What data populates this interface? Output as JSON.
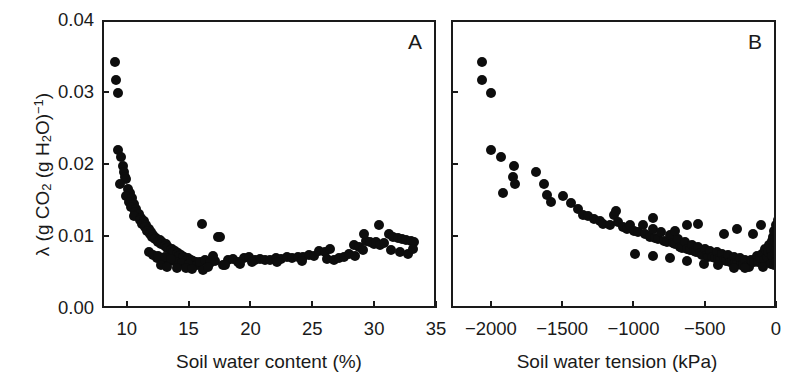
{
  "figure": {
    "ylabel_lambda": "λ (g CO",
    "ylabel_sub1": "2",
    "ylabel_mid": " (g H",
    "ylabel_sub2": "2",
    "ylabel_mid2": "O)",
    "ylabel_sup": "−1",
    "ylabel_end": ")",
    "ylabel_full": "λ (g CO2 (g H2O)−1)",
    "marker_color": "#0d0d0d",
    "axis_color": "#1a1a1a",
    "background_color": "#ffffff"
  },
  "panels": [
    {
      "id": "A",
      "label": "A",
      "xlabel": "Soil water content (%)",
      "xticks": [
        "10",
        "15",
        "20",
        "25",
        "30",
        "35"
      ],
      "xtick_values": [
        10,
        15,
        20,
        25,
        30,
        35
      ],
      "yticks": [
        "0.00",
        "0.01",
        "0.02",
        "0.03",
        "0.04"
      ],
      "ytick_values": [
        0.0,
        0.01,
        0.02,
        0.03,
        0.04
      ]
    },
    {
      "id": "B",
      "label": "B",
      "xlabel": "Soil water tension (kPa)",
      "xticks": [
        "−2000",
        "−1500",
        "−1000",
        "−500",
        "0"
      ],
      "xtick_values": [
        -2000,
        -1500,
        -1000,
        -500,
        0
      ],
      "yticks": [
        "0.00",
        "0.01",
        "0.02",
        "0.03",
        "0.04"
      ],
      "ytick_values": [
        0.0,
        0.01,
        0.02,
        0.03,
        0.04
      ]
    }
  ],
  "chart_data": [
    {
      "type": "scatter",
      "panel": "A",
      "title": "",
      "xlabel": "Soil water content (%)",
      "ylabel": "λ (g CO2 (g H2O)−1)",
      "xlim": [
        8.0,
        35.0
      ],
      "ylim": [
        0.0,
        0.04
      ],
      "grid": false,
      "legend": null,
      "annotation": "A",
      "points": [
        [
          8.9,
          0.0345
        ],
        [
          9.0,
          0.032
        ],
        [
          9.1,
          0.0302
        ],
        [
          9.1,
          0.0222
        ],
        [
          9.4,
          0.0212
        ],
        [
          9.5,
          0.02
        ],
        [
          9.6,
          0.0191
        ],
        [
          9.7,
          0.0185
        ],
        [
          9.8,
          0.0182
        ],
        [
          9.3,
          0.0175
        ],
        [
          9.9,
          0.0168
        ],
        [
          10.1,
          0.0162
        ],
        [
          9.8,
          0.0158
        ],
        [
          10.3,
          0.0155
        ],
        [
          10.0,
          0.015
        ],
        [
          10.4,
          0.0147
        ],
        [
          10.2,
          0.0143
        ],
        [
          10.6,
          0.014
        ],
        [
          10.5,
          0.0136
        ],
        [
          10.8,
          0.0133
        ],
        [
          10.4,
          0.013
        ],
        [
          11.0,
          0.0128
        ],
        [
          10.9,
          0.0125
        ],
        [
          11.2,
          0.0123
        ],
        [
          11.1,
          0.012
        ],
        [
          11.4,
          0.0118
        ],
        [
          11.3,
          0.0115
        ],
        [
          11.6,
          0.0113
        ],
        [
          11.5,
          0.011
        ],
        [
          11.8,
          0.0108
        ],
        [
          11.7,
          0.0106
        ],
        [
          12.0,
          0.0104
        ],
        [
          11.9,
          0.0102
        ],
        [
          12.2,
          0.01
        ],
        [
          12.1,
          0.0098
        ],
        [
          12.5,
          0.0097
        ],
        [
          12.4,
          0.0095
        ],
        [
          12.7,
          0.0094
        ],
        [
          12.6,
          0.0092
        ],
        [
          13.0,
          0.0091
        ],
        [
          12.9,
          0.0089
        ],
        [
          13.2,
          0.0088
        ],
        [
          13.1,
          0.0086
        ],
        [
          13.5,
          0.0085
        ],
        [
          13.4,
          0.0083
        ],
        [
          13.7,
          0.0082
        ],
        [
          13.6,
          0.008
        ],
        [
          14.0,
          0.0079
        ],
        [
          13.9,
          0.0078
        ],
        [
          14.2,
          0.0077
        ],
        [
          14.1,
          0.0075
        ],
        [
          14.5,
          0.0074
        ],
        [
          14.4,
          0.0073
        ],
        [
          14.8,
          0.0072
        ],
        [
          14.7,
          0.007
        ],
        [
          15.0,
          0.0069
        ],
        [
          15.2,
          0.0068
        ],
        [
          15.4,
          0.0067
        ],
        [
          12.3,
          0.0072
        ],
        [
          12.8,
          0.007
        ],
        [
          13.3,
          0.0068
        ],
        [
          13.8,
          0.0066
        ],
        [
          14.3,
          0.0065
        ],
        [
          14.9,
          0.0064
        ],
        [
          15.5,
          0.0063
        ],
        [
          11.6,
          0.008
        ],
        [
          12.0,
          0.0077
        ],
        [
          12.4,
          0.0075
        ],
        [
          12.9,
          0.0073
        ],
        [
          13.4,
          0.0071
        ],
        [
          12.6,
          0.0062
        ],
        [
          13.1,
          0.006
        ],
        [
          13.9,
          0.0059
        ],
        [
          14.6,
          0.0058
        ],
        [
          15.1,
          0.0057
        ],
        [
          15.8,
          0.0066
        ],
        [
          16.2,
          0.0069
        ],
        [
          16.0,
          0.0056
        ],
        [
          16.6,
          0.0065
        ],
        [
          17.0,
          0.0068
        ],
        [
          16.8,
          0.0075
        ],
        [
          15.9,
          0.012
        ],
        [
          17.2,
          0.0102
        ],
        [
          17.4,
          0.0101
        ],
        [
          17.6,
          0.0063
        ],
        [
          18.0,
          0.007
        ],
        [
          18.4,
          0.0071
        ],
        [
          18.8,
          0.0066
        ],
        [
          19.3,
          0.0072
        ],
        [
          19.7,
          0.0073
        ],
        [
          20.2,
          0.007
        ],
        [
          20.6,
          0.0071
        ],
        [
          21.0,
          0.007
        ],
        [
          21.4,
          0.0069
        ],
        [
          21.9,
          0.0072
        ],
        [
          22.3,
          0.0071
        ],
        [
          22.8,
          0.0073
        ],
        [
          23.2,
          0.0072
        ],
        [
          23.7,
          0.0074
        ],
        [
          24.1,
          0.0073
        ],
        [
          24.6,
          0.0076
        ],
        [
          25.0,
          0.0075
        ],
        [
          25.4,
          0.0082
        ],
        [
          25.9,
          0.008
        ],
        [
          26.3,
          0.0085
        ],
        [
          26.0,
          0.0071
        ],
        [
          26.6,
          0.007
        ],
        [
          27.0,
          0.0072
        ],
        [
          27.4,
          0.0074
        ],
        [
          27.8,
          0.0078
        ],
        [
          28.2,
          0.009
        ],
        [
          28.6,
          0.0088
        ],
        [
          28.3,
          0.0075
        ],
        [
          28.9,
          0.0083
        ],
        [
          29.2,
          0.0096
        ],
        [
          29.5,
          0.0095
        ],
        [
          29.8,
          0.0092
        ],
        [
          30.0,
          0.0094
        ],
        [
          30.3,
          0.009
        ],
        [
          30.6,
          0.0093
        ],
        [
          29.0,
          0.0106
        ],
        [
          30.2,
          0.0118
        ],
        [
          31.0,
          0.0105
        ],
        [
          31.4,
          0.0102
        ],
        [
          31.8,
          0.01
        ],
        [
          32.1,
          0.0098
        ],
        [
          32.4,
          0.0097
        ],
        [
          32.8,
          0.0096
        ],
        [
          33.1,
          0.0094
        ],
        [
          31.2,
          0.0083
        ],
        [
          31.9,
          0.008
        ],
        [
          32.6,
          0.0078
        ],
        [
          33.0,
          0.0085
        ],
        [
          16.4,
          0.006
        ],
        [
          17.8,
          0.0062
        ],
        [
          19.0,
          0.0064
        ],
        [
          20.0,
          0.0066
        ],
        [
          22.0,
          0.0067
        ],
        [
          24.0,
          0.0068
        ]
      ]
    },
    {
      "type": "scatter",
      "panel": "B",
      "title": "",
      "xlabel": "Soil water tension (kPa)",
      "ylabel": "λ (g CO2 (g H2O)−1)",
      "xlim": [
        -2280,
        0
      ],
      "ylim": [
        0.0,
        0.04
      ],
      "grid": false,
      "legend": null,
      "annotation": "B",
      "points": [
        [
          -2080,
          0.0345
        ],
        [
          -2075,
          0.032
        ],
        [
          -2010,
          0.0302
        ],
        [
          -2015,
          0.0222
        ],
        [
          -1940,
          0.0212
        ],
        [
          -1855,
          0.02
        ],
        [
          -1860,
          0.0185
        ],
        [
          -1845,
          0.0175
        ],
        [
          -1930,
          0.0162
        ],
        [
          -1700,
          0.0192
        ],
        [
          -1640,
          0.0175
        ],
        [
          -1620,
          0.016
        ],
        [
          -1590,
          0.015
        ],
        [
          -1510,
          0.0158
        ],
        [
          -1455,
          0.0148
        ],
        [
          -1400,
          0.014
        ],
        [
          -1370,
          0.0132
        ],
        [
          -1330,
          0.013
        ],
        [
          -1290,
          0.0126
        ],
        [
          -1250,
          0.0123
        ],
        [
          -1230,
          0.012
        ],
        [
          -1180,
          0.0118
        ],
        [
          -1150,
          0.0132
        ],
        [
          -1120,
          0.0122
        ],
        [
          -1090,
          0.0115
        ],
        [
          -1060,
          0.0112
        ],
        [
          -1040,
          0.0118
        ],
        [
          -1010,
          0.011
        ],
        [
          -980,
          0.0108
        ],
        [
          -950,
          0.0118
        ],
        [
          -930,
          0.0105
        ],
        [
          -900,
          0.0102
        ],
        [
          -880,
          0.0112
        ],
        [
          -860,
          0.01
        ],
        [
          -840,
          0.0098
        ],
        [
          -820,
          0.0109
        ],
        [
          -800,
          0.0096
        ],
        [
          -780,
          0.0095
        ],
        [
          -760,
          0.0104
        ],
        [
          -740,
          0.0093
        ],
        [
          -720,
          0.0091
        ],
        [
          -700,
          0.0098
        ],
        [
          -690,
          0.0088
        ],
        [
          -670,
          0.0086
        ],
        [
          -655,
          0.0094
        ],
        [
          -640,
          0.0085
        ],
        [
          -620,
          0.0083
        ],
        [
          -605,
          0.009
        ],
        [
          -590,
          0.0082
        ],
        [
          -575,
          0.008
        ],
        [
          -560,
          0.0088
        ],
        [
          -545,
          0.0079
        ],
        [
          -530,
          0.0077
        ],
        [
          -515,
          0.0085
        ],
        [
          -500,
          0.0076
        ],
        [
          -490,
          0.0074
        ],
        [
          -475,
          0.0082
        ],
        [
          -460,
          0.0073
        ],
        [
          -445,
          0.0072
        ],
        [
          -430,
          0.008
        ],
        [
          -420,
          0.0071
        ],
        [
          -405,
          0.007
        ],
        [
          -390,
          0.0078
        ],
        [
          -380,
          0.0069
        ],
        [
          -365,
          0.0068
        ],
        [
          -350,
          0.0076
        ],
        [
          -340,
          0.0067
        ],
        [
          -325,
          0.0066
        ],
        [
          -310,
          0.0074
        ],
        [
          -300,
          0.0065
        ],
        [
          -285,
          0.0064
        ],
        [
          -270,
          0.0072
        ],
        [
          -260,
          0.0063
        ],
        [
          -245,
          0.0062
        ],
        [
          -230,
          0.007
        ],
        [
          -220,
          0.0061
        ],
        [
          -205,
          0.006
        ],
        [
          -190,
          0.0069
        ],
        [
          -180,
          0.0068
        ],
        [
          -165,
          0.0067
        ],
        [
          -150,
          0.0075
        ],
        [
          -140,
          0.0066
        ],
        [
          -125,
          0.0072
        ],
        [
          -110,
          0.0078
        ],
        [
          -100,
          0.007
        ],
        [
          -90,
          0.0085
        ],
        [
          -80,
          0.0074
        ],
        [
          -70,
          0.008
        ],
        [
          -60,
          0.009
        ],
        [
          -50,
          0.0082
        ],
        [
          -45,
          0.0096
        ],
        [
          -40,
          0.0075
        ],
        [
          -35,
          0.0102
        ],
        [
          -30,
          0.0088
        ],
        [
          -25,
          0.011
        ],
        [
          -20,
          0.0078
        ],
        [
          -18,
          0.0094
        ],
        [
          -15,
          0.0118
        ],
        [
          -12,
          0.0084
        ],
        [
          -10,
          0.01
        ],
        [
          -8,
          0.0072
        ],
        [
          -6,
          0.0092
        ],
        [
          -5,
          0.0108
        ],
        [
          -4,
          0.008
        ],
        [
          -3,
          0.0125
        ],
        [
          -2,
          0.007
        ],
        [
          -1,
          0.0098
        ],
        [
          -120,
          0.0118
        ],
        [
          -105,
          0.006
        ],
        [
          -230,
          0.0058
        ],
        [
          -310,
          0.0059
        ],
        [
          -420,
          0.0062
        ],
        [
          -520,
          0.0064
        ],
        [
          -640,
          0.0068
        ],
        [
          -760,
          0.0072
        ],
        [
          -880,
          0.0075
        ],
        [
          -1000,
          0.0078
        ],
        [
          -640,
          0.0118
        ],
        [
          -880,
          0.0128
        ],
        [
          -1140,
          0.0138
        ],
        [
          -380,
          0.0106
        ],
        [
          -290,
          0.0112
        ],
        [
          -175,
          0.0105
        ],
        [
          -560,
          0.012
        ],
        [
          -720,
          0.011
        ],
        [
          -50,
          0.0064
        ],
        [
          -30,
          0.0062
        ],
        [
          -15,
          0.0066
        ]
      ]
    }
  ]
}
